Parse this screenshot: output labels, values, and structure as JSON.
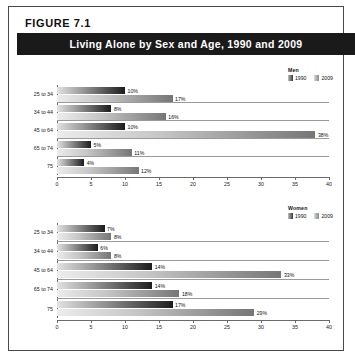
{
  "figure": {
    "label": "FIGURE  7.1",
    "title": "Living Alone by Sex and Age, 1990 and 2009"
  },
  "legend": {
    "men_title": "Men",
    "women_title": "Women",
    "series_1": "1990",
    "series_2": "2009"
  },
  "axis": {
    "ticks": [
      "0",
      "5",
      "10",
      "15",
      "20",
      "25",
      "30",
      "35",
      "40"
    ]
  },
  "colors": {
    "title_bar_bg": "#1a1a1a",
    "title_bar_text": "#ffffff",
    "frame_border": "#4a4a4a",
    "bar_1990_dark": "#1c1c1c",
    "bar_2009_mid": "#767676",
    "gridline": "#9a9a9a"
  },
  "chart_data": [
    {
      "type": "bar",
      "orientation": "horizontal",
      "title": "Men",
      "xlabel": "",
      "ylabel": "",
      "xlim": [
        0,
        40
      ],
      "grid": true,
      "legend_position": "top-right",
      "categories": [
        "25 to 34",
        "34 to 44",
        "45 to 64",
        "65 to 74",
        "75"
      ],
      "series": [
        {
          "name": "1990",
          "values": [
            10,
            8,
            10,
            5,
            4
          ],
          "labels": [
            "10%",
            "8%",
            "10%",
            "5%",
            "4%"
          ]
        },
        {
          "name": "2009",
          "values": [
            17,
            16,
            38,
            11,
            12
          ],
          "labels": [
            "17%",
            "16%",
            "38%",
            "11%",
            "12%"
          ]
        }
      ]
    },
    {
      "type": "bar",
      "orientation": "horizontal",
      "title": "Women",
      "xlabel": "",
      "ylabel": "",
      "xlim": [
        0,
        40
      ],
      "grid": true,
      "legend_position": "top-right",
      "categories": [
        "25 to 34",
        "34 to 44",
        "45 to 64",
        "65 to 74",
        "75"
      ],
      "series": [
        {
          "name": "1990",
          "values": [
            7,
            6,
            14,
            14,
            17
          ],
          "labels": [
            "7%",
            "6%",
            "14%",
            "14%",
            "17%"
          ]
        },
        {
          "name": "2009",
          "values": [
            8,
            8,
            33,
            18,
            29
          ],
          "labels": [
            "8%",
            "8%",
            "33%",
            "18%",
            "29%"
          ]
        }
      ]
    }
  ]
}
